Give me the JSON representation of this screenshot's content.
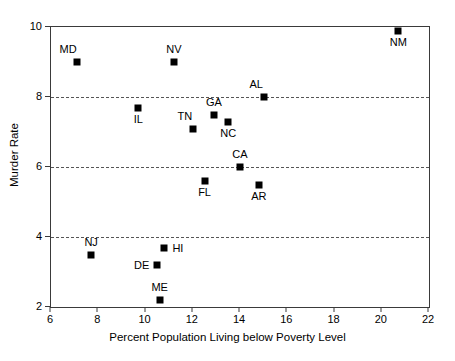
{
  "chart_data": {
    "type": "scatter",
    "title": "",
    "xlabel": "Percent Population Living below Poverty Level",
    "ylabel": "Murder Rate",
    "xlim": [
      6,
      22
    ],
    "ylim": [
      2,
      10
    ],
    "xticks": [
      6,
      8,
      10,
      12,
      14,
      16,
      18,
      20,
      22
    ],
    "yticks": [
      2,
      4,
      6,
      8,
      10
    ],
    "grid": "horizontal-dashed",
    "gridlines_y": [
      4,
      6,
      8
    ],
    "legend": "none",
    "marker": "filled-square-black",
    "points": [
      {
        "label": "MD",
        "x": 7.1,
        "y": 9.0,
        "label_pos": "above-left"
      },
      {
        "label": "NV",
        "x": 11.2,
        "y": 9.0,
        "label_pos": "above"
      },
      {
        "label": "NM",
        "x": 20.7,
        "y": 9.9,
        "label_pos": "below"
      },
      {
        "label": "AL",
        "x": 15.0,
        "y": 8.0,
        "label_pos": "above-left"
      },
      {
        "label": "IL",
        "x": 9.7,
        "y": 7.7,
        "label_pos": "below"
      },
      {
        "label": "GA",
        "x": 12.9,
        "y": 7.5,
        "label_pos": "above"
      },
      {
        "label": "TN",
        "x": 12.0,
        "y": 7.1,
        "label_pos": "above-left"
      },
      {
        "label": "NC",
        "x": 13.5,
        "y": 7.3,
        "label_pos": "below"
      },
      {
        "label": "CA",
        "x": 14.0,
        "y": 6.0,
        "label_pos": "above"
      },
      {
        "label": "FL",
        "x": 12.5,
        "y": 5.6,
        "label_pos": "below"
      },
      {
        "label": "AR",
        "x": 14.8,
        "y": 5.5,
        "label_pos": "below"
      },
      {
        "label": "HI",
        "x": 10.8,
        "y": 3.7,
        "label_pos": "right"
      },
      {
        "label": "NJ",
        "x": 7.7,
        "y": 3.5,
        "label_pos": "above"
      },
      {
        "label": "DE",
        "x": 10.5,
        "y": 3.2,
        "label_pos": "left"
      },
      {
        "label": "ME",
        "x": 10.6,
        "y": 2.2,
        "label_pos": "above"
      }
    ],
    "colors": {
      "marker": "#000000",
      "axis": "#3a3a3a",
      "grid": "#555555",
      "background": "#ffffff",
      "text": "#000000"
    }
  }
}
